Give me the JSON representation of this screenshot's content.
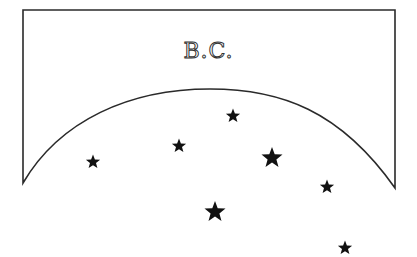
{
  "label": "B.C.",
  "colors": {
    "stroke": "#2a2a2a",
    "star": "#111111",
    "background": "#ffffff"
  },
  "shape": {
    "left": 23,
    "right": 395,
    "top": 10,
    "left_bottom": 183,
    "right_bottom": 188,
    "arc_peak": {
      "x": 210,
      "y": 89
    }
  },
  "stars": [
    {
      "x": 93,
      "y": 162,
      "size": "small"
    },
    {
      "x": 179,
      "y": 146,
      "size": "small"
    },
    {
      "x": 233,
      "y": 116,
      "size": "small"
    },
    {
      "x": 272,
      "y": 158,
      "size": "large"
    },
    {
      "x": 215,
      "y": 212,
      "size": "large"
    },
    {
      "x": 327,
      "y": 187,
      "size": "small"
    },
    {
      "x": 345,
      "y": 248,
      "size": "small"
    }
  ]
}
